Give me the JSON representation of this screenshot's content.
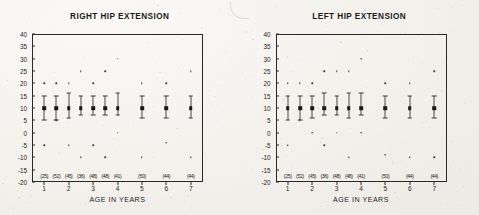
{
  "figure": {
    "x_axis_title": "AGE IN YEARS",
    "y_ticks": [
      40,
      35,
      30,
      25,
      20,
      15,
      10,
      5,
      0,
      -5,
      -10,
      -15,
      -20
    ],
    "x_ticks": [
      1,
      2,
      3,
      4,
      5,
      6,
      7
    ],
    "y_min": -20,
    "y_max": 40,
    "x_min": 0.5,
    "x_max": 7.5
  },
  "panels": [
    {
      "id": "right-hip-extension",
      "title": "RIGHT HIP EXTENSION",
      "sample_labels": [
        {
          "x": 1.0,
          "text": "(25)"
        },
        {
          "x": 1.5,
          "text": "(52)"
        },
        {
          "x": 2.0,
          "text": "(45)"
        },
        {
          "x": 2.5,
          "text": "(36)"
        },
        {
          "x": 3.0,
          "text": "(48)"
        },
        {
          "x": 3.5,
          "text": "(48)"
        },
        {
          "x": 4.0,
          "text": "(41)"
        },
        {
          "x": 5.0,
          "text": "(50)"
        },
        {
          "x": 6.0,
          "text": "(44)"
        },
        {
          "x": 7.0,
          "text": "(44)"
        }
      ],
      "groups": [
        {
          "x": 1.0,
          "median": 10,
          "low": 5,
          "high": 15
        },
        {
          "x": 1.5,
          "median": 10,
          "low": 5,
          "high": 15
        },
        {
          "x": 2.0,
          "median": 10,
          "low": 6,
          "high": 16
        },
        {
          "x": 2.5,
          "median": 10,
          "low": 7,
          "high": 15
        },
        {
          "x": 3.0,
          "median": 10,
          "low": 7,
          "high": 15
        },
        {
          "x": 3.5,
          "median": 10,
          "low": 7,
          "high": 15
        },
        {
          "x": 4.0,
          "median": 10,
          "low": 7,
          "high": 16
        },
        {
          "x": 5.0,
          "median": 10,
          "low": 6,
          "high": 15
        },
        {
          "x": 6.0,
          "median": 10,
          "low": 6,
          "high": 15
        },
        {
          "x": 7.0,
          "median": 10,
          "low": 6,
          "high": 15
        }
      ],
      "outliers": [
        {
          "x": 1.0,
          "y": 20
        },
        {
          "x": 1.5,
          "y": 20
        },
        {
          "x": 2.0,
          "y": 20
        },
        {
          "x": 2.5,
          "y": 25
        },
        {
          "x": 3.0,
          "y": 20
        },
        {
          "x": 3.5,
          "y": 25
        },
        {
          "x": 4.0,
          "y": 30
        },
        {
          "x": 5.0,
          "y": 20
        },
        {
          "x": 6.0,
          "y": 20
        },
        {
          "x": 7.0,
          "y": 25
        },
        {
          "x": 1.5,
          "y": 5
        },
        {
          "x": 4.0,
          "y": 0
        },
        {
          "x": 1.0,
          "y": -5
        },
        {
          "x": 2.0,
          "y": -5
        },
        {
          "x": 3.0,
          "y": -5
        },
        {
          "x": 6.0,
          "y": -4
        },
        {
          "x": 2.5,
          "y": -10
        },
        {
          "x": 3.5,
          "y": -10
        },
        {
          "x": 5.0,
          "y": -10
        },
        {
          "x": 7.0,
          "y": -10
        }
      ]
    },
    {
      "id": "left-hip-extension",
      "title": "LEFT HIP EXTENSION",
      "sample_labels": [
        {
          "x": 1.0,
          "text": "(25)"
        },
        {
          "x": 1.5,
          "text": "(52)"
        },
        {
          "x": 2.0,
          "text": "(45)"
        },
        {
          "x": 2.5,
          "text": "(36)"
        },
        {
          "x": 3.0,
          "text": "(48)"
        },
        {
          "x": 3.5,
          "text": "(48)"
        },
        {
          "x": 4.0,
          "text": "(41)"
        },
        {
          "x": 5.0,
          "text": "(50)"
        },
        {
          "x": 6.0,
          "text": "(44)"
        },
        {
          "x": 7.0,
          "text": "(44)"
        }
      ],
      "groups": [
        {
          "x": 1.0,
          "median": 10,
          "low": 5,
          "high": 15
        },
        {
          "x": 1.5,
          "median": 10,
          "low": 5,
          "high": 15
        },
        {
          "x": 2.0,
          "median": 10,
          "low": 6,
          "high": 15
        },
        {
          "x": 2.5,
          "median": 10,
          "low": 7,
          "high": 16
        },
        {
          "x": 3.0,
          "median": 10,
          "low": 7,
          "high": 15
        },
        {
          "x": 3.5,
          "median": 10,
          "low": 6,
          "high": 16
        },
        {
          "x": 4.0,
          "median": 10,
          "low": 7,
          "high": 16
        },
        {
          "x": 5.0,
          "median": 10,
          "low": 6,
          "high": 15
        },
        {
          "x": 6.0,
          "median": 10,
          "low": 6,
          "high": 15
        },
        {
          "x": 7.0,
          "median": 10,
          "low": 6,
          "high": 15
        }
      ],
      "outliers": [
        {
          "x": 1.0,
          "y": 20
        },
        {
          "x": 1.5,
          "y": 20
        },
        {
          "x": 2.0,
          "y": 20
        },
        {
          "x": 2.5,
          "y": 25
        },
        {
          "x": 3.0,
          "y": 25
        },
        {
          "x": 3.5,
          "y": 25
        },
        {
          "x": 4.0,
          "y": 30
        },
        {
          "x": 5.0,
          "y": 20
        },
        {
          "x": 6.0,
          "y": 20
        },
        {
          "x": 7.0,
          "y": 25
        },
        {
          "x": 1.5,
          "y": 5
        },
        {
          "x": 2.0,
          "y": 0
        },
        {
          "x": 3.0,
          "y": 0
        },
        {
          "x": 4.0,
          "y": 0
        },
        {
          "x": 1.0,
          "y": -5
        },
        {
          "x": 2.5,
          "y": -5
        },
        {
          "x": 5.0,
          "y": -9
        },
        {
          "x": 3.5,
          "y": -10
        },
        {
          "x": 6.0,
          "y": -10
        },
        {
          "x": 7.0,
          "y": -10
        }
      ]
    }
  ],
  "chart_data": {
    "type": "scatter",
    "xlabel": "AGE IN YEARS",
    "ylabel": "",
    "xlim": [
      0.5,
      7.5
    ],
    "ylim": [
      -20,
      40
    ],
    "grid": false,
    "legend": "none",
    "x": [
      1.0,
      1.5,
      2.0,
      2.5,
      3.0,
      3.5,
      4.0,
      5.0,
      6.0,
      7.0
    ],
    "series": [
      {
        "name": "RIGHT HIP EXTENSION median",
        "values": [
          10,
          10,
          10,
          10,
          10,
          10,
          10,
          10,
          10,
          10
        ]
      },
      {
        "name": "RIGHT HIP EXTENSION lower whisker",
        "values": [
          5,
          5,
          6,
          7,
          7,
          7,
          7,
          6,
          6,
          6
        ]
      },
      {
        "name": "RIGHT HIP EXTENSION upper whisker",
        "values": [
          15,
          15,
          16,
          15,
          15,
          15,
          16,
          15,
          15,
          15
        ]
      },
      {
        "name": "LEFT HIP EXTENSION median",
        "values": [
          10,
          10,
          10,
          10,
          10,
          10,
          10,
          10,
          10,
          10
        ]
      },
      {
        "name": "LEFT HIP EXTENSION lower whisker",
        "values": [
          5,
          5,
          6,
          7,
          7,
          6,
          7,
          6,
          6,
          6
        ]
      },
      {
        "name": "LEFT HIP EXTENSION upper whisker",
        "values": [
          15,
          15,
          15,
          16,
          15,
          16,
          16,
          15,
          15,
          15
        ]
      }
    ],
    "sample_sizes": [
      25,
      52,
      45,
      36,
      48,
      48,
      41,
      50,
      44,
      44
    ],
    "annotations": [
      "RIGHT HIP EXTENSION",
      "LEFT HIP EXTENSION",
      "AGE IN YEARS"
    ]
  }
}
